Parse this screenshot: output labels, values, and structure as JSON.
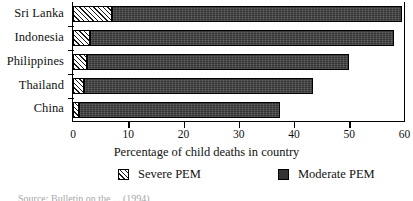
{
  "chart_data": {
    "type": "bar",
    "orientation": "horizontal",
    "stacked": true,
    "title": "",
    "xlabel": "Percentage of child deaths in country",
    "ylabel": "",
    "categories": [
      "Sri Lanka",
      "Indonesia",
      "Philippines",
      "Thailand",
      "China"
    ],
    "series": [
      {
        "name": "Severe PEM",
        "values": [
          7,
          3,
          2.5,
          2,
          1
        ]
      },
      {
        "name": "Moderate PEM",
        "values": [
          52.5,
          55,
          47.5,
          41.5,
          36.5
        ]
      }
    ],
    "totals": [
      59.5,
      58,
      50,
      43.5,
      37.5
    ],
    "xlim": [
      0,
      60
    ],
    "xticks": [
      0,
      10,
      20,
      30,
      40,
      50,
      60
    ],
    "xticklabels": [
      "0",
      "10",
      "20",
      "30",
      "40",
      "50",
      "60"
    ],
    "grid": false,
    "legend_position": "bottom",
    "colors": {
      "severe": "#ffffff",
      "severe_hatch": "#1a1a1a",
      "moderate": "#333333",
      "axis": "#000000",
      "text": "#111111"
    }
  },
  "legend": {
    "items": [
      {
        "label": "Severe PEM",
        "swatch": "hatched-swatch"
      },
      {
        "label": "Moderate PEM",
        "swatch": "solid-dark-swatch"
      }
    ]
  },
  "source": {
    "text": "Source: Bulletin on the ... (1994)"
  }
}
